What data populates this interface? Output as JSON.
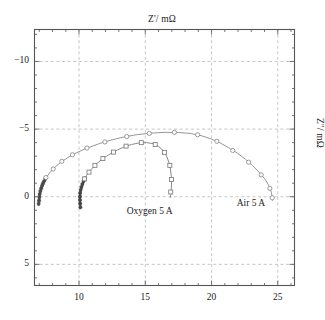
{
  "chart_data": {
    "type": "scatter",
    "title": "",
    "xlabel": "Z'/ mΩ",
    "ylabel": "Z''/ mΩ",
    "top_axis_label": "Z'/ mΩ",
    "right_axis_label": "Z''/ mΩ",
    "xlim": [
      6.6,
      26.3
    ],
    "ylim": [
      6.6,
      -12.4
    ],
    "y_inverted": true,
    "grid": true,
    "grid_color": "#b9b9b9",
    "grid_style": "dashed",
    "legend_position": "in-plot-annotations",
    "xticks": [
      10,
      15,
      20,
      25
    ],
    "xtick_labels": [
      "10",
      "15",
      "20",
      "25"
    ],
    "yticks": [
      -10,
      -5,
      0,
      5
    ],
    "ytick_labels": [
      "−10",
      "−5",
      "0",
      "5"
    ],
    "xminor_step": 1,
    "yminor_step": 1,
    "series": [
      {
        "name": "Air 5 A",
        "marker": "circle-open",
        "color": "#8a8a8a",
        "dark_color": "#4a4a4a",
        "label_text": "Air 5 A",
        "label_x": 22.2,
        "label_y": 0.55,
        "points": [
          [
            6.95,
            0.55
          ],
          [
            6.98,
            0.3
          ],
          [
            7.0,
            0.05
          ],
          [
            7.03,
            -0.18
          ],
          [
            7.08,
            -0.4
          ],
          [
            7.14,
            -0.6
          ],
          [
            7.2,
            -0.78
          ],
          [
            7.27,
            -0.95
          ],
          [
            7.35,
            -1.12
          ],
          [
            7.45,
            -1.3
          ],
          [
            7.58,
            -1.5
          ],
          [
            7.75,
            -1.72
          ],
          [
            7.95,
            -1.95
          ],
          [
            8.2,
            -2.2
          ],
          [
            8.5,
            -2.45
          ],
          [
            8.85,
            -2.7
          ],
          [
            9.25,
            -2.95
          ],
          [
            9.7,
            -3.2
          ],
          [
            10.25,
            -3.45
          ],
          [
            10.9,
            -3.7
          ],
          [
            11.6,
            -3.95
          ],
          [
            12.4,
            -4.18
          ],
          [
            13.3,
            -4.4
          ],
          [
            14.3,
            -4.58
          ],
          [
            15.4,
            -4.7
          ],
          [
            16.5,
            -4.76
          ],
          [
            17.5,
            -4.75
          ],
          [
            18.4,
            -4.68
          ],
          [
            19.2,
            -4.52
          ],
          [
            19.95,
            -4.28
          ],
          [
            20.65,
            -3.98
          ],
          [
            21.3,
            -3.62
          ],
          [
            21.95,
            -3.22
          ],
          [
            22.55,
            -2.78
          ],
          [
            23.1,
            -2.3
          ],
          [
            23.6,
            -1.8
          ],
          [
            24.05,
            -1.28
          ],
          [
            24.35,
            -0.78
          ],
          [
            24.52,
            -0.32
          ],
          [
            24.58,
            0.05
          ],
          [
            24.6,
            0.3
          ]
        ],
        "marker_points": [
          [
            7.5,
            -1.42
          ],
          [
            8.05,
            -2.05
          ],
          [
            8.7,
            -2.62
          ],
          [
            9.5,
            -3.1
          ],
          [
            10.6,
            -3.6
          ],
          [
            11.95,
            -4.05
          ],
          [
            13.6,
            -4.45
          ],
          [
            15.3,
            -4.68
          ],
          [
            17.2,
            -4.76
          ],
          [
            18.95,
            -4.58
          ],
          [
            20.4,
            -4.1
          ],
          [
            21.6,
            -3.42
          ],
          [
            22.8,
            -2.55
          ],
          [
            23.75,
            -1.62
          ],
          [
            24.4,
            -0.62
          ],
          [
            24.58,
            0.08
          ]
        ],
        "dense_tail": {
          "from": [
            6.95,
            0.58
          ],
          "to": [
            7.45,
            -1.3
          ]
        }
      },
      {
        "name": "Oxygen 5 A",
        "marker": "square-open",
        "color": "#7d7d7d",
        "dark_color": "#454545",
        "label_text": "Oxygen 5 A",
        "label_x": 13.6,
        "label_y": 1.1,
        "points": [
          [
            10.1,
            0.8
          ],
          [
            10.08,
            0.52
          ],
          [
            10.07,
            0.26
          ],
          [
            10.07,
            0.0
          ],
          [
            10.08,
            -0.25
          ],
          [
            10.12,
            -0.48
          ],
          [
            10.18,
            -0.7
          ],
          [
            10.25,
            -0.92
          ],
          [
            10.34,
            -1.14
          ],
          [
            10.45,
            -1.36
          ],
          [
            10.58,
            -1.58
          ],
          [
            10.74,
            -1.8
          ],
          [
            10.92,
            -2.02
          ],
          [
            11.14,
            -2.26
          ],
          [
            11.4,
            -2.5
          ],
          [
            11.7,
            -2.74
          ],
          [
            12.05,
            -2.98
          ],
          [
            12.45,
            -3.22
          ],
          [
            12.9,
            -3.46
          ],
          [
            13.4,
            -3.68
          ],
          [
            13.95,
            -3.86
          ],
          [
            14.55,
            -3.98
          ],
          [
            15.1,
            -4.0
          ],
          [
            15.6,
            -3.92
          ],
          [
            16.0,
            -3.72
          ],
          [
            16.35,
            -3.42
          ],
          [
            16.6,
            -3.02
          ],
          [
            16.78,
            -2.55
          ],
          [
            16.9,
            -2.05
          ],
          [
            16.96,
            -1.52
          ],
          [
            16.98,
            -1.02
          ],
          [
            16.96,
            -0.55
          ],
          [
            16.92,
            -0.18
          ],
          [
            16.88,
            0.08
          ]
        ],
        "marker_points": [
          [
            10.42,
            -1.32
          ],
          [
            10.75,
            -1.82
          ],
          [
            11.2,
            -2.32
          ],
          [
            11.8,
            -2.82
          ],
          [
            12.6,
            -3.3
          ],
          [
            13.55,
            -3.74
          ],
          [
            14.7,
            -4.0
          ],
          [
            15.75,
            -3.86
          ],
          [
            16.45,
            -3.28
          ],
          [
            16.85,
            -2.32
          ],
          [
            16.98,
            -1.28
          ],
          [
            16.92,
            -0.35
          ]
        ],
        "dense_tail": {
          "from": [
            10.1,
            0.85
          ],
          "to": [
            10.45,
            -1.36
          ]
        }
      }
    ]
  },
  "frame": {
    "left_px": 34,
    "top_px": 29,
    "right_px": 295,
    "bottom_px": 286,
    "border_color": "#555555"
  }
}
